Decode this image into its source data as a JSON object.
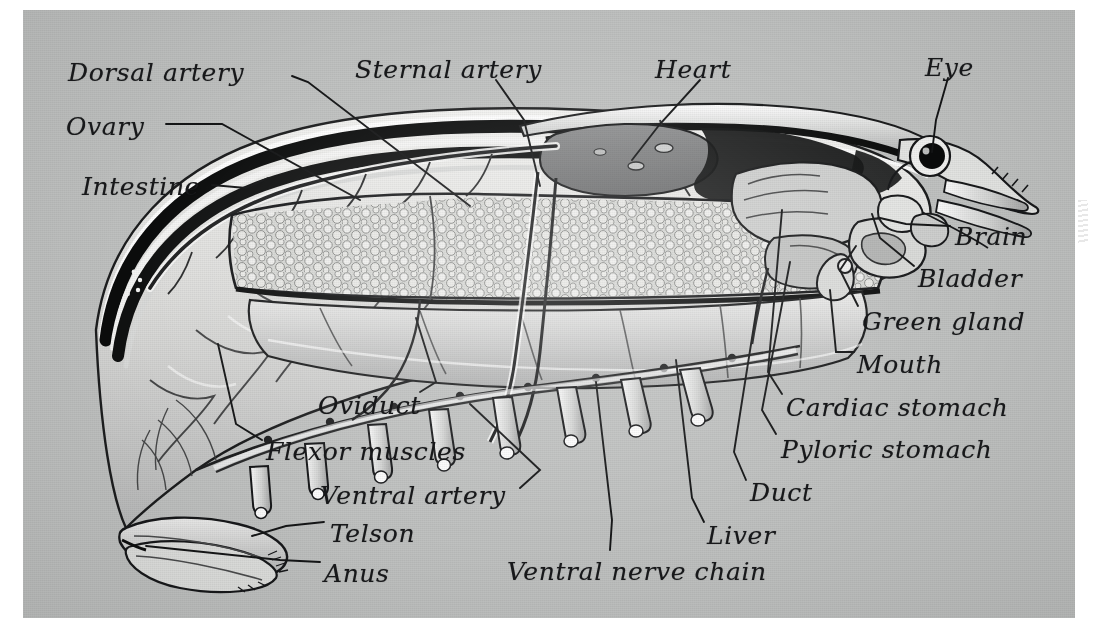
{
  "plate": {
    "title": "Internal anatomy of the crayfish (sagittal dissection)",
    "subject": "crayfish",
    "background_color": "#bfc1c0",
    "page_color": "#ffffff",
    "ink_color": "#17181a",
    "style": "halftone engraving, italic hand-lettered labels with leader lines"
  },
  "labels": [
    {
      "id": "dorsal-artery",
      "text": "Dorsal artery",
      "x": 68,
      "y": 58,
      "size": "s26"
    },
    {
      "id": "sternal-artery",
      "text": "Sternal artery",
      "x": 355,
      "y": 55,
      "size": "s26"
    },
    {
      "id": "heart",
      "text": "Heart",
      "x": 655,
      "y": 55,
      "size": "s26"
    },
    {
      "id": "eye",
      "text": "Eye",
      "x": 925,
      "y": 53,
      "size": "s26"
    },
    {
      "id": "ovary",
      "text": "Ovary",
      "x": 66,
      "y": 112,
      "size": "s26"
    },
    {
      "id": "intestine",
      "text": "Intestine",
      "x": 82,
      "y": 172,
      "size": "s26"
    },
    {
      "id": "brain",
      "text": "Brain",
      "x": 955,
      "y": 222,
      "size": "s26"
    },
    {
      "id": "bladder",
      "text": "Bladder",
      "x": 918,
      "y": 264,
      "size": "s26"
    },
    {
      "id": "green-gland",
      "text": "Green gland",
      "x": 862,
      "y": 307,
      "size": "s26"
    },
    {
      "id": "mouth",
      "text": "Mouth",
      "x": 857,
      "y": 350,
      "size": "s26"
    },
    {
      "id": "oviduct",
      "text": "Oviduct",
      "x": 318,
      "y": 391,
      "size": "s26"
    },
    {
      "id": "cardiac-stomach",
      "text": "Cardiac stomach",
      "x": 786,
      "y": 393,
      "size": "s26"
    },
    {
      "id": "flexor-muscles",
      "text": "Flexor muscles",
      "x": 266,
      "y": 437,
      "size": "s26"
    },
    {
      "id": "pyloric-stomach",
      "text": "Pyloric stomach",
      "x": 781,
      "y": 435,
      "size": "s26"
    },
    {
      "id": "ventral-artery",
      "text": "Ventral artery",
      "x": 320,
      "y": 481,
      "size": "s26"
    },
    {
      "id": "duct",
      "text": "Duct",
      "x": 750,
      "y": 478,
      "size": "s26"
    },
    {
      "id": "telson",
      "text": "Telson",
      "x": 330,
      "y": 519,
      "size": "s26"
    },
    {
      "id": "liver",
      "text": "Liver",
      "x": 707,
      "y": 521,
      "size": "s26"
    },
    {
      "id": "anus",
      "text": "Anus",
      "x": 324,
      "y": 559,
      "size": "s26"
    },
    {
      "id": "ventral-nerve-chain",
      "text": "Ventral nerve chain",
      "x": 507,
      "y": 557,
      "size": "s26"
    }
  ],
  "anatomy_parts": [
    "dorsal-artery",
    "sternal-artery",
    "heart",
    "eye",
    "ovary",
    "intestine",
    "brain",
    "bladder",
    "green-gland",
    "mouth",
    "oviduct",
    "cardiac-stomach",
    "flexor-muscles",
    "pyloric-stomach",
    "ventral-artery",
    "duct",
    "telson",
    "liver",
    "anus",
    "ventral-nerve-chain",
    "carapace",
    "abdomen",
    "rostrum",
    "antenna",
    "walking-legs",
    "swimmerets",
    "uropods",
    "tail-fan"
  ]
}
